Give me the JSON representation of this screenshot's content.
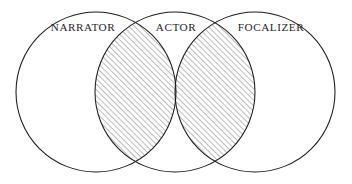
{
  "figure": {
    "type": "venn-diagram",
    "background_color": "#ffffff",
    "stroke_color": "#1a1a1a",
    "hatch_color": "#4a4a4a",
    "label_color": "#26242a",
    "width": 352,
    "height": 184
  },
  "chart_data": {
    "type": "diagram",
    "diagram_kind": "venn",
    "title": "",
    "sets": [
      {
        "id": "narrator",
        "label": "NARRATOR",
        "cx": 96,
        "cy": 92,
        "r": 80,
        "fill": "none",
        "label_x": 83,
        "label_y": 31
      },
      {
        "id": "actor",
        "label": "ACTOR",
        "cx": 175,
        "cy": 92,
        "r": 80,
        "fill": "none",
        "label_x": 176,
        "label_y": 31
      },
      {
        "id": "focalizer",
        "label": "FOCALIZER",
        "cx": 255,
        "cy": 92,
        "r": 80,
        "fill": "none",
        "label_x": 271,
        "label_y": 31
      }
    ],
    "intersections": [
      {
        "id": "narrator-actor",
        "sets": [
          "narrator",
          "actor"
        ],
        "fill": "diagonal-hatch",
        "label": ""
      },
      {
        "id": "actor-focalizer",
        "sets": [
          "actor",
          "focalizer"
        ],
        "fill": "diagonal-hatch",
        "label": ""
      }
    ],
    "hatch": {
      "angle_degrees": 45,
      "direction": "lower-left-to-upper-right",
      "spacing_px": 4,
      "line_width_px": 0.75
    },
    "legend": null,
    "annotations": []
  },
  "labels": {
    "narrator": "NARRATOR",
    "actor": "ACTOR",
    "focalizer": "FOCALIZER"
  }
}
